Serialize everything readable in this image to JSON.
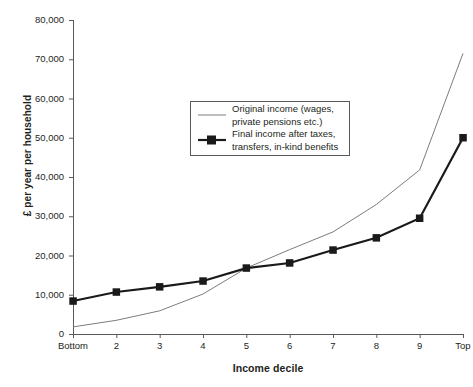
{
  "chart_data": {
    "type": "line",
    "title": "",
    "xlabel": "Income decile",
    "ylabel": "£ per year per household",
    "categories": [
      "Bottom",
      "2",
      "3",
      "4",
      "5",
      "6",
      "7",
      "8",
      "9",
      "Top"
    ],
    "xtick_labels": [
      "Bottom",
      "2",
      "3",
      "4",
      "5",
      "6",
      "7",
      "8",
      "9",
      "Top"
    ],
    "ytick_labels": [
      "0",
      "10,000",
      "20,000",
      "30,000",
      "40,000",
      "50,000",
      "60,000",
      "70,000",
      "80,000"
    ],
    "ytick_values": [
      0,
      10000,
      20000,
      30000,
      40000,
      50000,
      60000,
      70000,
      80000
    ],
    "ylim": [
      0,
      80000
    ],
    "grid": false,
    "legend_position": "center",
    "series": [
      {
        "name": "Original income (wages, private pensions etc.)",
        "style": "thin-line",
        "color": "#7c7c7c",
        "markers": false,
        "values": [
          1800,
          3500,
          5900,
          10200,
          16800,
          21500,
          26000,
          33000,
          41800,
          71500
        ]
      },
      {
        "name": "Final income after taxes, transfers, in-kind benefits",
        "style": "thick-line-square-markers",
        "color": "#1a1a1a",
        "markers": true,
        "values": [
          8400,
          10700,
          12000,
          13500,
          16800,
          18100,
          21400,
          24500,
          29500,
          50000
        ]
      }
    ]
  },
  "legend": {
    "items": [
      {
        "line1": "Original income (wages,",
        "line2": "private pensions etc.)"
      },
      {
        "line1": "Final income after taxes,",
        "line2": "transfers, in-kind benefits"
      }
    ]
  }
}
